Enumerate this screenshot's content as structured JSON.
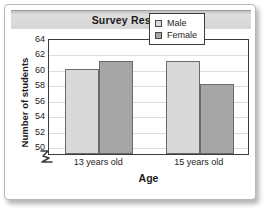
{
  "card": {
    "background_color": "#ffffff",
    "border_color": "#b7b7b7"
  },
  "title_band": {
    "background_color": "#d6d6d6"
  },
  "legend": {
    "position": "top-right",
    "entries": [
      {
        "label": "Male",
        "color": "#d9d9d9",
        "swatch_name": "legend-swatch-male"
      },
      {
        "label": "Female",
        "color": "#a6a6a6",
        "swatch_name": "legend-swatch-female"
      }
    ]
  },
  "axis_break": {
    "name": "y-axis-break-zigzag",
    "present": true
  },
  "chart_data": {
    "type": "bar",
    "title": "Survey Results",
    "xlabel": "Age",
    "ylabel": "Number of students",
    "categories": [
      "13 years old",
      "15 years old"
    ],
    "series": [
      {
        "name": "Male",
        "values": [
          60,
          61
        ],
        "color": "#d9d9d9"
      },
      {
        "name": "Female",
        "values": [
          61,
          58
        ],
        "color": "#a6a6a6"
      }
    ],
    "yticks": [
      50,
      52,
      54,
      56,
      58,
      60,
      62,
      64
    ],
    "ylim": [
      49,
      64
    ],
    "grid": true,
    "legend_position": "top-right",
    "axis_break_below": 50
  }
}
